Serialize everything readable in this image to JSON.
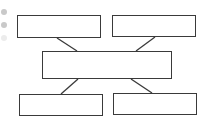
{
  "diagram": {
    "type": "hierarchy-blank",
    "line_color": "#3a3a3a",
    "boxes": [
      {
        "id": "top-left",
        "label": ""
      },
      {
        "id": "top-right",
        "label": ""
      },
      {
        "id": "center",
        "label": ""
      },
      {
        "id": "bottom-left",
        "label": ""
      },
      {
        "id": "bottom-right",
        "label": ""
      }
    ],
    "connections": [
      {
        "from": "top-left",
        "to": "center"
      },
      {
        "from": "top-right",
        "to": "center"
      },
      {
        "from": "center",
        "to": "bottom-left"
      },
      {
        "from": "center",
        "to": "bottom-right"
      }
    ],
    "side_markers": [
      "bullet",
      "bullet",
      "bullet-faint"
    ]
  }
}
